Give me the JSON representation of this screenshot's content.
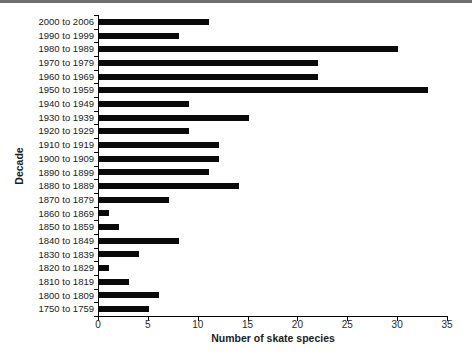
{
  "figure": {
    "background": "#ffffff",
    "top_rule_color": "#6e6e6e"
  },
  "chart_data": {
    "type": "bar",
    "orientation": "horizontal",
    "title": "",
    "xlabel": "Number of skate species",
    "ylabel": "Decade",
    "xlim": [
      0,
      35
    ],
    "xticks": [
      "0",
      "5",
      "10",
      "15",
      "20",
      "25",
      "30",
      "35"
    ],
    "grid": false,
    "legend_position": "none",
    "bar_color": "#0a0a0a",
    "axis_color": "#000000",
    "categories": [
      "2000 to 2006",
      "1990 to 1999",
      "1980 to 1989",
      "1970 to 1979",
      "1960 to 1969",
      "1950 to 1959",
      "1940 to 1949",
      "1930 to 1939",
      "1920 to 1929",
      "1910 to 1919",
      "1900 to 1909",
      "1890 to 1899",
      "1880 to 1889",
      "1870 to 1879",
      "1860 to 1869",
      "1850 to 1859",
      "1840 to 1849",
      "1830 to 1839",
      "1820 to 1829",
      "1810 to 1819",
      "1800 to 1809",
      "1750 to 1759"
    ],
    "values": [
      11,
      8,
      30,
      22,
      22,
      33,
      9,
      15,
      9,
      12,
      12,
      11,
      14,
      7,
      1,
      2,
      8,
      4,
      1,
      3,
      6,
      5
    ]
  }
}
